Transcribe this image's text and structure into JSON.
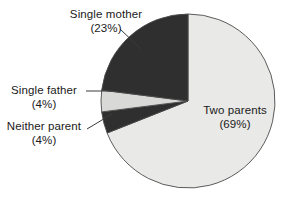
{
  "chart_data": {
    "type": "pie",
    "title": "",
    "subtitle": "",
    "xlabel": "",
    "ylabel": "",
    "legend_position": "none",
    "grid": false,
    "units": "percent",
    "start_angle_deg": 0,
    "direction": "clockwise",
    "categories": [
      "Two parents",
      "Neither parent",
      "Single father",
      "Single mother"
    ],
    "values": [
      69,
      4,
      4,
      23
    ],
    "slices": [
      {
        "name": "two-parents",
        "label": "Two parents",
        "value": 69,
        "value_text": "(69%)",
        "color": "#e9e9e7",
        "start_deg": 0,
        "sweep_deg": 248.4
      },
      {
        "name": "neither-parent",
        "label": "Neither parent",
        "value": 4,
        "value_text": "(4%)",
        "color": "#2f2f2f",
        "start_deg": 248.4,
        "sweep_deg": 14.4
      },
      {
        "name": "single-father",
        "label": "Single father",
        "value": 4,
        "value_text": "(4%)",
        "color": "#d9d9d7",
        "start_deg": 262.8,
        "sweep_deg": 14.4
      },
      {
        "name": "single-mother",
        "label": "Single mother",
        "value": 23,
        "value_text": "(23%)",
        "color": "#2f2f2f",
        "start_deg": 277.2,
        "sweep_deg": 82.8
      }
    ],
    "colors": {
      "dark_slice": "#2f2f2f",
      "light_slice": "#e9e9e7",
      "mid_slice": "#d9d9d7",
      "outline": "#4a4a4a",
      "text": "#1a1a1a",
      "background": "#ffffff"
    },
    "geometry": {
      "center_x": 188,
      "center_y": 101,
      "radius": 87
    }
  },
  "labels": {
    "single_mother": {
      "line1": "Single mother",
      "line2": "(23%)"
    },
    "single_father": {
      "line1": "Single father",
      "line2": "(4%)"
    },
    "neither_parent": {
      "line1": "Neither parent",
      "line2": "(4%)"
    },
    "two_parents": {
      "line1": "Two parents",
      "line2": "(69%)"
    }
  }
}
